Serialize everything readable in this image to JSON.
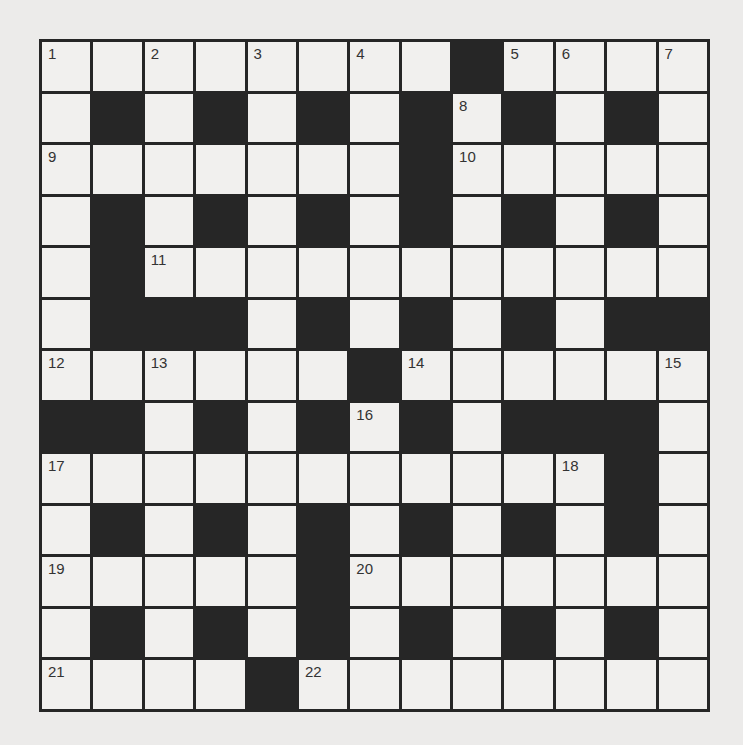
{
  "puzzle": {
    "type": "crossword",
    "rows": 13,
    "cols": 13,
    "colors": {
      "block": "#262626",
      "cell": "#f1f0ee",
      "background": "#ecebea",
      "number": "#333333"
    },
    "layout": [
      "WWWWWWWWBWWWW",
      "WBWBWBWBWBWBW",
      "WWWWWWWBWWWWW",
      "WBWBWBWBWBWBW",
      "WBWWWWWWWWWWW",
      "WBBBWBWBWBWBB",
      "WWWWWWBWWWWWW",
      "BBWBWBWBWBBBW",
      "WWWWWWWWWWWBW",
      "WBWBWBWBWBWBW",
      "WWWWWBWWWWWWW",
      "WBWBWBWBWBWBW",
      "WWWWBWWWWWWWW"
    ],
    "numbers": [
      {
        "n": "1",
        "r": 0,
        "c": 0
      },
      {
        "n": "2",
        "r": 0,
        "c": 2
      },
      {
        "n": "3",
        "r": 0,
        "c": 4
      },
      {
        "n": "4",
        "r": 0,
        "c": 6
      },
      {
        "n": "5",
        "r": 0,
        "c": 9
      },
      {
        "n": "6",
        "r": 0,
        "c": 10
      },
      {
        "n": "7",
        "r": 0,
        "c": 12
      },
      {
        "n": "8",
        "r": 1,
        "c": 8
      },
      {
        "n": "9",
        "r": 2,
        "c": 0
      },
      {
        "n": "10",
        "r": 2,
        "c": 8
      },
      {
        "n": "11",
        "r": 4,
        "c": 2
      },
      {
        "n": "12",
        "r": 6,
        "c": 0
      },
      {
        "n": "13",
        "r": 6,
        "c": 2
      },
      {
        "n": "14",
        "r": 6,
        "c": 7
      },
      {
        "n": "15",
        "r": 6,
        "c": 12
      },
      {
        "n": "16",
        "r": 7,
        "c": 6
      },
      {
        "n": "17",
        "r": 8,
        "c": 0
      },
      {
        "n": "18",
        "r": 8,
        "c": 10
      },
      {
        "n": "19",
        "r": 10,
        "c": 0
      },
      {
        "n": "20",
        "r": 10,
        "c": 6
      },
      {
        "n": "21",
        "r": 12,
        "c": 0
      },
      {
        "n": "22",
        "r": 12,
        "c": 5
      }
    ]
  }
}
